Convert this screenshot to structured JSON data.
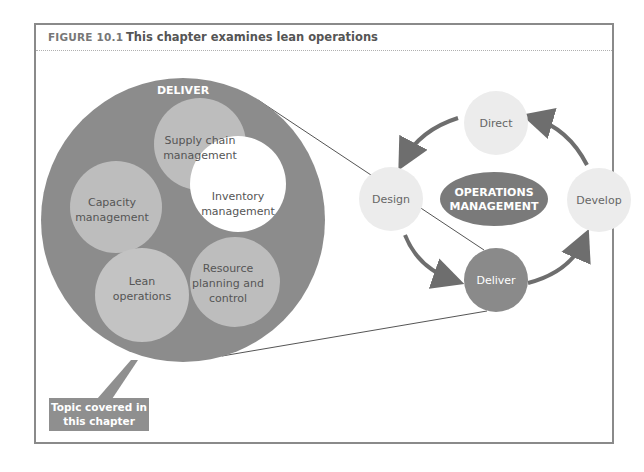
{
  "figure": {
    "number": "FIGURE 10.1",
    "title": "This chapter examines lean operations"
  },
  "deliver_detail": {
    "label": "DELIVER",
    "topics": [
      {
        "line1": "Supply chain",
        "line2": "management",
        "line3": ""
      },
      {
        "line1": "Capacity",
        "line2": "management",
        "line3": ""
      },
      {
        "line1": "Inventory",
        "line2": "management",
        "line3": ""
      },
      {
        "line1": "Lean",
        "line2": "operations",
        "line3": ""
      },
      {
        "line1": "Resource",
        "line2": "planning and",
        "line3": "control"
      }
    ]
  },
  "cycle": {
    "center_line1": "OPERATIONS",
    "center_line2": "MANAGEMENT",
    "nodes": [
      {
        "label": "Direct"
      },
      {
        "label": "Design"
      },
      {
        "label": "Deliver"
      },
      {
        "label": "Develop"
      }
    ]
  },
  "callout": {
    "line1": "Topic covered in",
    "line2": "this chapter"
  },
  "colors": {
    "outer_circle": "#8c8c8c",
    "topic_circle": "#bdbdbd",
    "highlight_topic": "#ffffff",
    "cycle_node": "#ececec",
    "deliver_node": "#8a8a8a",
    "center_ellipse": "#7a7a7a",
    "arrow": "#6e6e6e"
  }
}
